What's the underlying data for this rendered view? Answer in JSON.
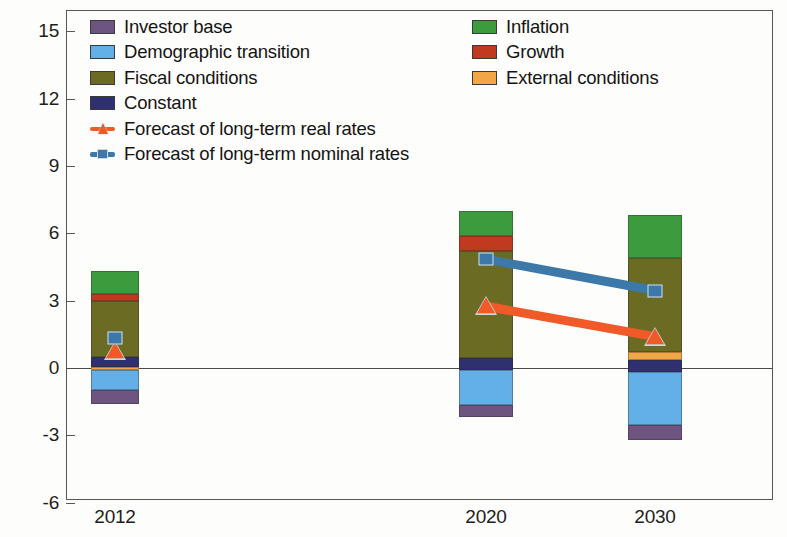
{
  "chart_data": {
    "type": "bar",
    "title": "",
    "subtitle": "",
    "xlabel": "",
    "ylabel": "",
    "categories": [
      "2012",
      "2020",
      "2030"
    ],
    "ylim": [
      -6,
      15
    ],
    "yticks": [
      -6,
      -3,
      0,
      3,
      6,
      9,
      12,
      15
    ],
    "ytick_labels": [
      "-6",
      "-3",
      "0",
      "3",
      "6",
      "9",
      "12",
      "15"
    ],
    "grid": false,
    "stacked": true,
    "legend_position": "top-inside",
    "zero_line": 0,
    "series": [
      {
        "name": "Investor base",
        "kind": "bar",
        "color": "#6E5480",
        "values": [
          -0.6,
          -0.55,
          -0.65
        ]
      },
      {
        "name": "Demographic transition",
        "kind": "bar",
        "color": "#63B0E8",
        "values": [
          -0.9,
          -1.55,
          -2.35
        ]
      },
      {
        "name": "Fiscal conditions",
        "kind": "bar",
        "color": "#6B6B23",
        "values": [
          2.5,
          4.75,
          4.2
        ]
      },
      {
        "name": "Constant",
        "kind": "bar",
        "color": "#2E3070",
        "values": [
          0.45,
          0.55,
          0.55
        ]
      },
      {
        "name": "Inflation",
        "kind": "bar",
        "color": "#3C9B3C",
        "values": [
          1.0,
          1.1,
          0.0
        ]
      },
      {
        "name": "Growth",
        "kind": "bar",
        "color": "#C1391E",
        "values": [
          0.3,
          0.7,
          1.9
        ]
      },
      {
        "name": "External conditions",
        "kind": "bar",
        "color": "#F4A546",
        "values": [
          -0.15,
          0.0,
          0.35
        ]
      },
      {
        "name": "Forecast of long-term real rates",
        "kind": "line",
        "color": "#F05A28",
        "values": [
          0.75,
          2.75,
          1.4
        ]
      },
      {
        "name": "Forecast of long-term nominal rates",
        "kind": "line",
        "color": "#3C78A8",
        "values": [
          1.35,
          4.85,
          3.45
        ]
      }
    ],
    "stack_totals": {
      "2012": 2.6,
      "2020": 4.8,
      "2030": 3.65
    }
  },
  "legend": {
    "left_items": [
      {
        "label": "Investor base",
        "color": "#6E5480",
        "marker": "swatch"
      },
      {
        "label": "Demographic transition",
        "color": "#63B0E8",
        "marker": "swatch"
      },
      {
        "label": "Fiscal conditions",
        "color": "#6B6B23",
        "marker": "swatch"
      },
      {
        "label": "Constant",
        "color": "#2E3070",
        "marker": "swatch"
      },
      {
        "label": "Forecast of long-term real rates",
        "color": "#F05A28",
        "marker": "line-triangle"
      },
      {
        "label": "Forecast of long-term nominal rates",
        "color": "#3C78A8",
        "marker": "line-square"
      }
    ],
    "right_items": [
      {
        "label": "Inflation",
        "color": "#3C9B3C",
        "marker": "swatch"
      },
      {
        "label": "Growth",
        "color": "#C1391E",
        "marker": "swatch"
      },
      {
        "label": "External conditions",
        "color": "#F4A546",
        "marker": "swatch"
      }
    ]
  },
  "axis": {
    "y_labels": [
      "15",
      "12",
      "9",
      "6",
      "3",
      "0",
      "-3",
      "-6"
    ],
    "x_labels": [
      "2012",
      "2020",
      "2030"
    ]
  },
  "colors": {
    "investor_base": "#6E5480",
    "demographic_transition": "#63B0E8",
    "fiscal_conditions": "#6B6B23",
    "constant": "#2E3070",
    "inflation": "#3C9B3C",
    "growth": "#C1391E",
    "external_conditions": "#F4A546",
    "real_rates_line": "#F05A28",
    "nominal_rates_line": "#3C78A8",
    "axis": "#575757",
    "text": "#141414",
    "background": "#fdfdfb"
  },
  "bars": [
    {
      "category": "2012",
      "x_center": 115,
      "width": 48,
      "segments": [
        {
          "name": "inflation",
          "from": 3.3,
          "to": 4.3,
          "color": "#3C9B3C"
        },
        {
          "name": "growth",
          "from": 3.0,
          "to": 3.3,
          "color": "#C1391E"
        },
        {
          "name": "fiscal-conditions",
          "from": 0.5,
          "to": 3.0,
          "color": "#6B6B23"
        },
        {
          "name": "constant",
          "from": 0.05,
          "to": 0.5,
          "color": "#2E3070"
        },
        {
          "name": "external-conditions",
          "from": -0.1,
          "to": 0.05,
          "color": "#F4A546"
        },
        {
          "name": "demographic-transition",
          "from": -1.0,
          "to": -0.1,
          "color": "#63B0E8"
        },
        {
          "name": "investor-base",
          "from": -1.6,
          "to": -1.0,
          "color": "#6E5480"
        }
      ]
    },
    {
      "category": "2020",
      "x_center": 486,
      "width": 54,
      "segments": [
        {
          "name": "inflation",
          "from": 5.9,
          "to": 7.0,
          "color": "#3C9B3C"
        },
        {
          "name": "growth",
          "from": 5.2,
          "to": 5.9,
          "color": "#C1391E"
        },
        {
          "name": "fiscal-conditions",
          "from": 0.45,
          "to": 5.2,
          "color": "#6B6B23"
        },
        {
          "name": "constant",
          "from": -0.1,
          "to": 0.45,
          "color": "#2E3070"
        },
        {
          "name": "demographic-transition",
          "from": -1.65,
          "to": -0.1,
          "color": "#63B0E8"
        },
        {
          "name": "investor-base",
          "from": -2.2,
          "to": -1.65,
          "color": "#6E5480"
        }
      ]
    },
    {
      "category": "2030",
      "x_center": 655,
      "width": 54,
      "segments": [
        {
          "name": "inflation",
          "from": 4.9,
          "to": 6.8,
          "color": "#3C9B3C"
        },
        {
          "name": "growth",
          "from": 4.9,
          "to": 4.9,
          "color": "#C1391E"
        },
        {
          "name": "fiscal-conditions",
          "from": 0.7,
          "to": 4.9,
          "color": "#6B6B23"
        },
        {
          "name": "external-conditions",
          "from": 0.35,
          "to": 0.7,
          "color": "#F4A546"
        },
        {
          "name": "constant",
          "from": -0.2,
          "to": 0.35,
          "color": "#2E3070"
        },
        {
          "name": "demographic-transition",
          "from": -2.55,
          "to": -0.2,
          "color": "#63B0E8"
        },
        {
          "name": "investor-base",
          "from": -3.2,
          "to": -2.55,
          "color": "#6E5480"
        }
      ]
    }
  ]
}
